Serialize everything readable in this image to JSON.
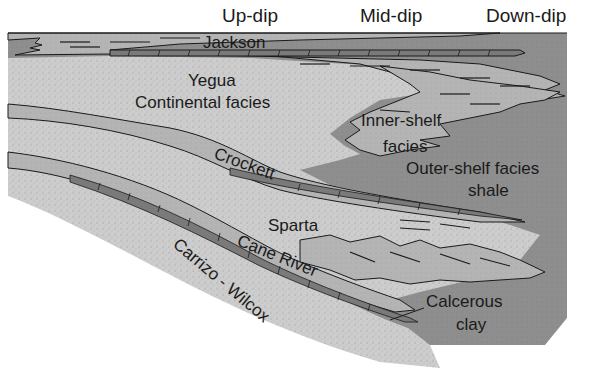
{
  "diagram": {
    "type": "stratigraphic-cross-section",
    "headers": {
      "up_dip": "Up-dip",
      "mid_dip": "Mid-dip",
      "down_dip": "Down-dip"
    },
    "units": {
      "jackson": "Jackson",
      "yegua_line1": "Yegua",
      "yegua_line2": "Continental facies",
      "inner_shelf_line1": "Inner-shelf",
      "inner_shelf_line2": "facies",
      "outer_shelf_line1": "Outer-shelf facies",
      "outer_shelf_line2": "shale",
      "crockett": "Crockett",
      "sparta": "Sparta",
      "cane_river": "Cane River",
      "carrizo_wilcox": "Carrizo - Wilcox",
      "calcareous_line1": "Calcerous",
      "calcareous_line2": "clay"
    },
    "colors": {
      "shale": "#8f8f8f",
      "continental_sand": "#cfcfcf",
      "inner_shelf": "#b3b3b3",
      "clay_band": "#7a7a7a",
      "outline": "#1a1a1a",
      "background": "#ffffff"
    }
  }
}
